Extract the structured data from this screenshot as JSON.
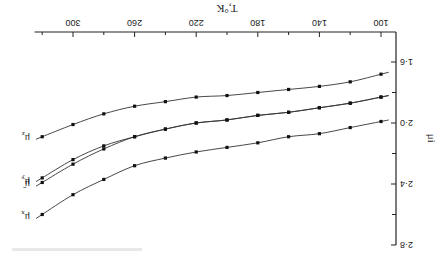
{
  "chart_data": {
    "type": "line",
    "title": "",
    "orientation_note": "rendered rotated 180 degrees",
    "xlabel": "T,°K",
    "ylabel": "μi",
    "xlim": [
      90,
      325
    ],
    "ylim": [
      1.6,
      2.8
    ],
    "x_ticks": [
      100,
      140,
      180,
      220,
      260,
      300
    ],
    "x_tick_labels": [
      "100",
      "140",
      "180",
      "220",
      "260",
      "300"
    ],
    "x_minor_ticks": [
      120,
      160,
      200,
      240,
      280,
      320
    ],
    "y_ticks": [
      1.6,
      2.0,
      2.4,
      2.8
    ],
    "y_tick_labels": [
      "1·6",
      "2·0",
      "2·4",
      "2·8"
    ],
    "y_minor_ticks": [
      1.8,
      2.2,
      2.6
    ],
    "grid": false,
    "legend": "inline labels at curve ends",
    "x": [
      100,
      120,
      140,
      160,
      180,
      200,
      220,
      240,
      260,
      280,
      300,
      320
    ],
    "series": [
      {
        "name": "μz",
        "label_main": "μ",
        "label_sub": "z",
        "values": [
          1.68,
          1.73,
          1.76,
          1.78,
          1.8,
          1.82,
          1.83,
          1.86,
          1.89,
          1.94,
          2.01,
          2.09
        ]
      },
      {
        "name": "μ̄",
        "label_main": "μ̄",
        "label_sub": "",
        "values": [
          1.83,
          1.87,
          1.9,
          1.93,
          1.95,
          1.98,
          2.0,
          2.04,
          2.09,
          2.15,
          2.24,
          2.36
        ]
      },
      {
        "name": "μy",
        "label_main": "μ",
        "label_sub": "y",
        "values": [
          1.83,
          1.87,
          1.9,
          1.93,
          1.95,
          1.98,
          2.0,
          2.04,
          2.09,
          2.17,
          2.27,
          2.39
        ]
      },
      {
        "name": "μx",
        "label_main": "μ",
        "label_sub": "x",
        "values": [
          1.99,
          2.03,
          2.07,
          2.09,
          2.13,
          2.16,
          2.19,
          2.23,
          2.28,
          2.37,
          2.47,
          2.6
        ]
      }
    ]
  }
}
